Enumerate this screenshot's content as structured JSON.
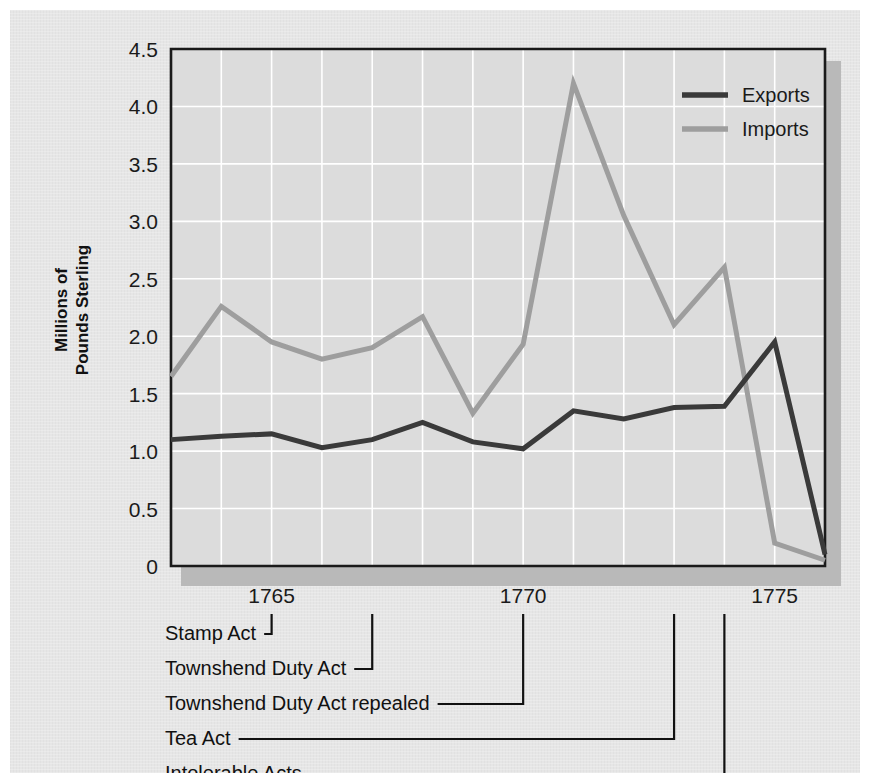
{
  "chart_data": {
    "type": "line",
    "title": "",
    "xlabel": "",
    "ylabel": "Millions of Pounds Sterling",
    "ylabel_line1": "Millions of",
    "ylabel_line2": "Pounds Sterling",
    "x": [
      1763,
      1764,
      1765,
      1766,
      1767,
      1768,
      1769,
      1770,
      1771,
      1772,
      1773,
      1774,
      1775,
      1776
    ],
    "xlim": [
      1763,
      1776
    ],
    "ylim": [
      0,
      4.5
    ],
    "y_ticks": [
      "0",
      "0.5",
      "1.0",
      "1.5",
      "2.0",
      "2.5",
      "3.0",
      "3.5",
      "4.0",
      "4.5"
    ],
    "y_tick_values": [
      0,
      0.5,
      1.0,
      1.5,
      2.0,
      2.5,
      3.0,
      3.5,
      4.0,
      4.5
    ],
    "x_ticks": [
      "1765",
      "1770",
      "1775"
    ],
    "x_tick_values": [
      1765,
      1770,
      1775
    ],
    "grid": true,
    "legend_position": "top-right",
    "series": [
      {
        "name": "Exports",
        "color": "#3a3a3a",
        "values": [
          1.1,
          1.13,
          1.15,
          1.03,
          1.1,
          1.25,
          1.08,
          1.02,
          1.35,
          1.28,
          1.38,
          1.39,
          1.95,
          0.1
        ]
      },
      {
        "name": "Imports",
        "color": "#9e9e9e",
        "values": [
          1.65,
          2.26,
          1.95,
          1.8,
          1.9,
          2.17,
          1.33,
          1.93,
          4.2,
          3.05,
          2.1,
          2.6,
          0.2,
          0.05
        ]
      }
    ],
    "annotations": [
      {
        "label": "Stamp Act",
        "year": 1765
      },
      {
        "label": "Townshend Duty Act",
        "year": 1767
      },
      {
        "label": "Townshend Duty Act repealed",
        "year": 1770
      },
      {
        "label": "Tea Act",
        "year": 1773
      },
      {
        "label": "Intolerable Acts",
        "year": 1774
      }
    ]
  },
  "legend": {
    "items": [
      {
        "label": "Exports",
        "color": "#3a3a3a"
      },
      {
        "label": "Imports",
        "color": "#9e9e9e"
      }
    ]
  },
  "colors": {
    "page_background": "#e6e6e6",
    "plot_background": "#dcdcdc",
    "grid": "#ffffff",
    "axis": "#1a1a1a",
    "exports": "#3a3a3a",
    "imports": "#9e9e9e"
  }
}
